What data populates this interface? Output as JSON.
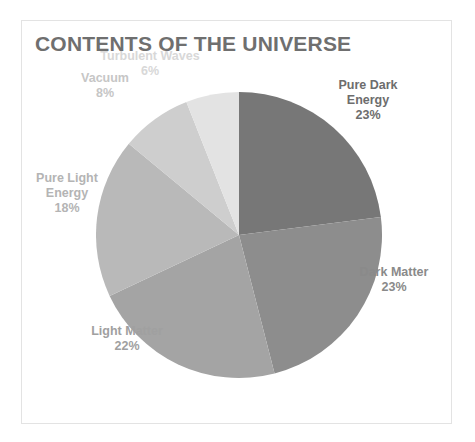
{
  "card": {
    "title": "CONTENTS OF THE UNIVERSE",
    "background": "#ffffff",
    "border_color": "#e3e3e3",
    "title_color": "#6f6f6f"
  },
  "chart_data": {
    "type": "pie",
    "title": "CONTENTS OF THE UNIVERSE",
    "xlabel": "",
    "ylabel": "",
    "legend_position": "none",
    "grid": false,
    "start_angle_deg": 0,
    "direction": "clockwise",
    "total": 100,
    "unit": "%",
    "categories": [
      "Pure Dark Energy",
      "Dark Matter",
      "Light Matter",
      "Pure Light Energy",
      "Vacuum",
      "Turbulent Waves"
    ],
    "values": [
      23,
      23,
      22,
      18,
      8,
      6
    ],
    "colors": [
      "#777777",
      "#8d8d8d",
      "#a4a4a4",
      "#b9b9b9",
      "#cecece",
      "#e3e3e3"
    ],
    "slices": [
      {
        "label": "Pure Dark Energy",
        "label_line1": "Pure Dark",
        "label_line2": "Energy",
        "value": 23,
        "percent_text": "23%",
        "color": "#777777",
        "label_color": "#6d6d6d"
      },
      {
        "label": "Dark Matter",
        "label_line1": "Dark Matter",
        "label_line2": "",
        "value": 23,
        "percent_text": "23%",
        "color": "#8d8d8d",
        "label_color": "#8a8a8a"
      },
      {
        "label": "Light Matter",
        "label_line1": "Light Matter",
        "label_line2": "",
        "value": 22,
        "percent_text": "22%",
        "color": "#a4a4a4",
        "label_color": "#a0a0a0"
      },
      {
        "label": "Pure Light Energy",
        "label_line1": "Pure Light",
        "label_line2": "Energy",
        "value": 18,
        "percent_text": "18%",
        "color": "#b9b9b9",
        "label_color": "#b4b4b4"
      },
      {
        "label": "Vacuum",
        "label_line1": "Vacuum",
        "label_line2": "",
        "value": 8,
        "percent_text": "8%",
        "color": "#cecece",
        "label_color": "#c6c6c6"
      },
      {
        "label": "Turbulent Waves",
        "label_line1": "Turbulent Waves",
        "label_line2": "",
        "value": 6,
        "percent_text": "6%",
        "color": "#e3e3e3",
        "label_color": "#d8d8d8"
      }
    ]
  }
}
